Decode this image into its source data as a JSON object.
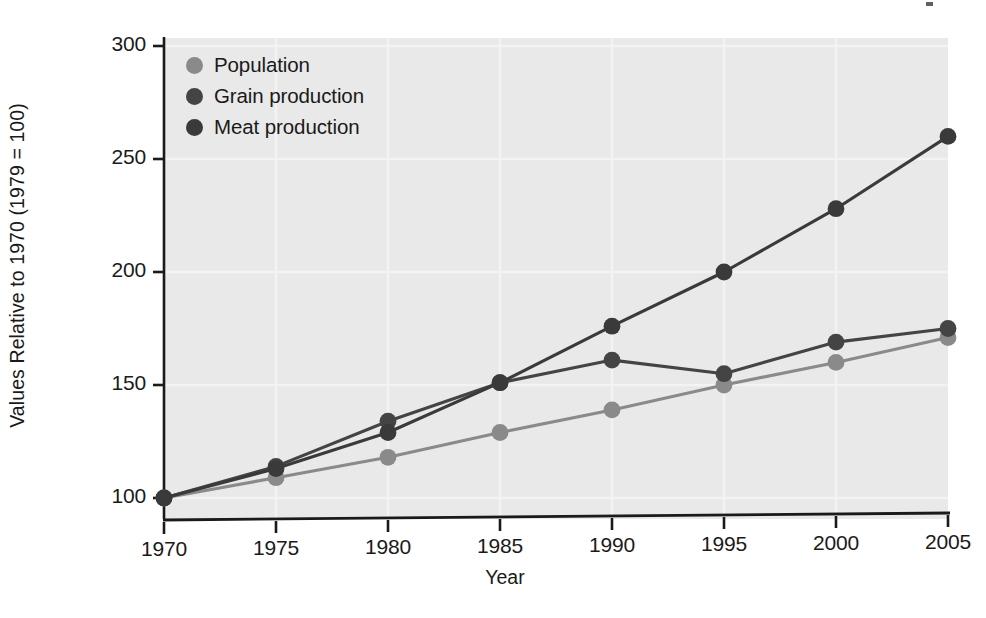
{
  "chart_data": {
    "type": "line",
    "title": "",
    "xlabel": "Year",
    "ylabel": "Values Relative to 1970 (1979 = 100)",
    "x": [
      1970,
      1975,
      1980,
      1985,
      1990,
      1995,
      2000,
      2005
    ],
    "xtick_labels": [
      "1970",
      "1975",
      "1980",
      "1985",
      "1990",
      "1995",
      "2000",
      "2005"
    ],
    "ytick_labels": [
      "100",
      "150",
      "200",
      "250",
      "300"
    ],
    "ytick_values": [
      100,
      150,
      200,
      250,
      300
    ],
    "xlim": [
      1970,
      2005
    ],
    "ylim": [
      88,
      300
    ],
    "grid": true,
    "legend_position": "top-left",
    "series": [
      {
        "name": "Population",
        "color": "#8a8a8a",
        "values": [
          100,
          109,
          118,
          129,
          139,
          150,
          160,
          171
        ]
      },
      {
        "name": "Grain production",
        "color": "#444444",
        "values": [
          100,
          114,
          134,
          151,
          161,
          155,
          169,
          175
        ]
      },
      {
        "name": "Meat production",
        "color": "#3a3a3a",
        "values": [
          100,
          113,
          129,
          151,
          176,
          200,
          228,
          260
        ]
      }
    ]
  },
  "legend": {
    "items": [
      {
        "label": "Population",
        "color": "#8a8a8a"
      },
      {
        "label": "Grain production",
        "color": "#444444"
      },
      {
        "label": "Meat production",
        "color": "#3a3a3a"
      }
    ]
  },
  "axes": {
    "x_title": "Year",
    "y_title": "Values Relative to 1970 (1979 = 100)"
  },
  "colors": {
    "plot_background": "#e9e9e9",
    "figure_background": "#ffffff",
    "axis": "#1a1a1a",
    "gridline": "#f3f3f3",
    "text": "#1a1a1a"
  }
}
